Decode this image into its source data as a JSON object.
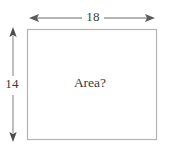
{
  "figure": {
    "type": "geometry-diagram",
    "shape": "rectangle",
    "width_label": "18",
    "height_label": "14",
    "interior_label": "Area?",
    "colors": {
      "background": "#ffffff",
      "rectangle_stroke": "#b3b3b3",
      "dimension_stroke": "#6b6b6b",
      "text": "#3d3d3d"
    },
    "rectangle": {
      "x": 27,
      "y": 29,
      "width": 130,
      "height": 111
    },
    "width_arrow": {
      "y": 18,
      "x_start": 29,
      "x_end": 155,
      "gap_start": 82,
      "gap_end": 104
    },
    "height_arrow": {
      "x": 13,
      "y_start": 27,
      "y_end": 142,
      "gap_start": 76,
      "gap_end": 95
    }
  }
}
